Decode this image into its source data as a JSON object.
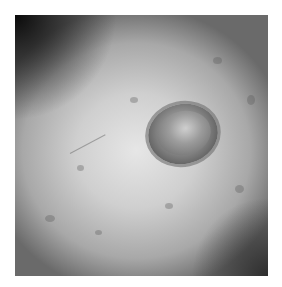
{
  "image": {
    "subject": "grayscale dermoscopic image of a skin lesion",
    "description": "Oval raised lesion with heterogeneous texture on surrounding skin, darker vignetting at the top-left corner",
    "colors": {
      "background": "#ffffff",
      "skin_center": "#e6e6e6",
      "skin_edge": "#6a6a6a",
      "lesion": "#8a8a8a",
      "lesion_rim": "#5a5a5a"
    }
  }
}
